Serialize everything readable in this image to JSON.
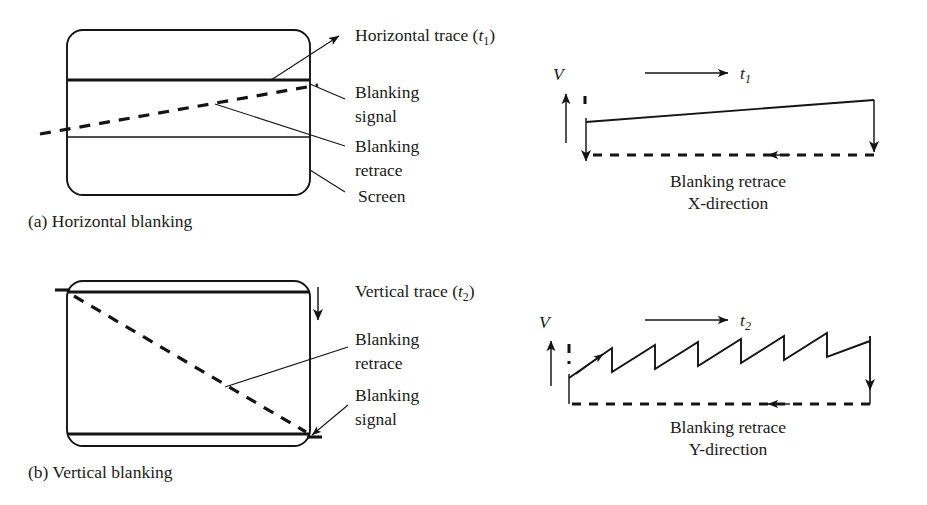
{
  "figure": {
    "title_implicit": "CRT horizontal and vertical blanking diagrams",
    "background_color": "#ffffff",
    "ink_color": "#141414"
  },
  "panel_a": {
    "caption": "(a) Horizontal blanking",
    "screen_labels": {
      "trace": "Horizontal trace (",
      "trace_var": "t",
      "trace_sub": "1",
      "trace_close": ")",
      "blanking_signal_line1": "Blanking",
      "blanking_signal_line2": "signal",
      "blanking_retrace_line1": "Blanking",
      "blanking_retrace_line2": "retrace",
      "screen": "Screen"
    }
  },
  "panel_b": {
    "caption": "(b) Vertical blanking",
    "screen_labels": {
      "trace": "Vertical trace (",
      "trace_var": "t",
      "trace_sub": "2",
      "trace_close": ")",
      "blanking_retrace_line1": "Blanking",
      "blanking_retrace_line2": "retrace",
      "blanking_signal_line1": "Blanking",
      "blanking_signal_line2": "signal"
    }
  },
  "chart_x": {
    "type": "line",
    "title": "",
    "ylabel": "V",
    "xlabel_var": "t",
    "xlabel_sub": "1",
    "caption_line1": "Blanking retrace",
    "caption_line2": "X-direction",
    "series": [
      {
        "name": "horizontal trace ramp",
        "style": "solid",
        "points": [
          [
            0,
            0.3
          ],
          [
            1,
            0.42
          ]
        ]
      },
      {
        "name": "blanking retrace baseline",
        "style": "dashed",
        "direction": "right-to-left",
        "points": [
          [
            1,
            0.0
          ],
          [
            0,
            0.0
          ]
        ]
      }
    ],
    "axis_range_x": [
      0,
      1
    ],
    "axis_range_y": [
      0,
      1
    ],
    "grid": false,
    "legend": "none"
  },
  "chart_y": {
    "type": "line",
    "title": "",
    "ylabel": "V",
    "xlabel_var": "t",
    "xlabel_sub": "2",
    "caption_line1": "Blanking retrace",
    "caption_line2": "Y-direction",
    "teeth_count": 7,
    "series": [
      {
        "name": "vertical sawtooth sweep",
        "style": "solid",
        "description": "seven rising ramps with fly-back drops, overall envelope rising slightly"
      },
      {
        "name": "blanking retrace baseline",
        "style": "dashed",
        "direction": "right-to-left"
      }
    ],
    "axis_range_x": [
      0,
      1
    ],
    "axis_range_y": [
      0,
      1
    ],
    "grid": false,
    "legend": "none"
  }
}
